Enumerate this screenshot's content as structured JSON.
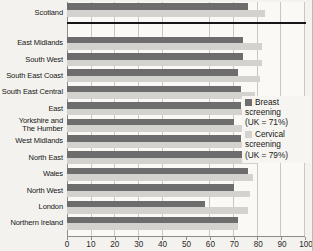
{
  "chart_data": {
    "type": "bar",
    "orientation": "horizontal",
    "title": "",
    "xlabel": "",
    "ylabel": "",
    "xlim": [
      0,
      100
    ],
    "x_ticks": [
      "0",
      "10",
      "20",
      "30",
      "40",
      "50",
      "60",
      "70",
      "80",
      "90",
      "100"
    ],
    "grid": true,
    "legend_position": "inside-right",
    "separator_after_category": "Scotland",
    "categories": [
      "Scotland",
      "East Midlands",
      "South West",
      "South East Coast",
      "South East Central",
      "East",
      "Yorkshire and The Humber",
      "West Midlands",
      "North East",
      "Wales",
      "North West",
      "London",
      "Northern Ireland"
    ],
    "category_label_lines": [
      [
        "Scotland"
      ],
      [
        "East Midlands"
      ],
      [
        "South West"
      ],
      [
        "South East Coast"
      ],
      [
        "South East Central"
      ],
      [
        "East"
      ],
      [
        "Yorkshire and",
        "The Humber"
      ],
      [
        "West Midlands"
      ],
      [
        "North East"
      ],
      [
        "Wales"
      ],
      [
        "North West"
      ],
      [
        "London"
      ],
      [
        "Northern Ireland"
      ]
    ],
    "series": [
      {
        "name": "Breast screening",
        "uk_average": "(UK = 71%)",
        "color": "#6d6d6d",
        "values": [
          76,
          74,
          74,
          72,
          73,
          73,
          70,
          73,
          74,
          76,
          70,
          58,
          72
        ]
      },
      {
        "name": "Cervical screening",
        "uk_average": "(UK = 79%)",
        "color": "#d3d2ce",
        "values": [
          83,
          82,
          82,
          81,
          79,
          78,
          78,
          79,
          80,
          78,
          77,
          76,
          72
        ]
      }
    ]
  },
  "legend": {
    "items": [
      {
        "label": "Breast screening",
        "uk": "(UK = 71%)",
        "color": "#6d6d6d"
      },
      {
        "label": "Cervical screening",
        "uk": "(UK = 79%)",
        "color": "#d3d2ce"
      }
    ]
  }
}
